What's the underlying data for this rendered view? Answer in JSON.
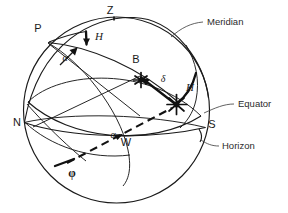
{
  "figure": {
    "background_color": "#ffffff",
    "line_color": "#1a1a1a",
    "width": 288,
    "height": 213
  },
  "points": {
    "zenith": "Z",
    "pole": "P",
    "star_point": "B",
    "north": "N",
    "south": "S",
    "west": "W"
  },
  "angles": {
    "hour_angle_top": "H",
    "hour_angle_right": "H",
    "right_ascension_top": "α",
    "right_ascension_bottom": "α",
    "declination": "δ",
    "latitude": "φ"
  },
  "callouts": [
    {
      "label": "Meridian"
    },
    {
      "label": "Equator"
    },
    {
      "label": "Horizon"
    }
  ],
  "markers": {
    "star_glyph": "star-asterisk",
    "zenith_tick": "tick-mark"
  }
}
